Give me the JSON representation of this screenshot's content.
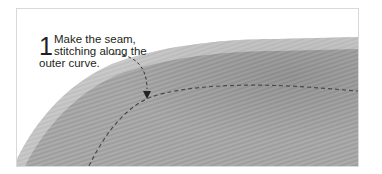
{
  "illustration": {
    "subject": "fabric-seam-photo",
    "colors": {
      "fabric": "#a5a5a5",
      "fabric_dark": "#8f8f8f",
      "stitch": "#4a4a4a",
      "background": "#ffffff",
      "frame_border": "#d9d9d9"
    }
  },
  "caption": {
    "step_number": "1",
    "lines": [
      "Make the seam,",
      "stitching along the",
      "outer curve."
    ]
  }
}
